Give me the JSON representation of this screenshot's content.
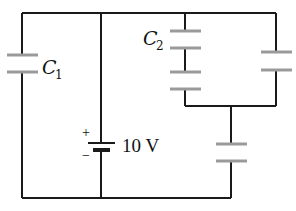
{
  "diagram": {
    "type": "circuit",
    "components": {
      "c1": {
        "label": "C",
        "subscript": "1"
      },
      "c2": {
        "label": "C",
        "subscript": "2"
      },
      "battery": {
        "voltage_label": "10 V",
        "plus": "+",
        "minus": "−"
      }
    },
    "colors": {
      "wire": "#1a1a1a",
      "plate": "#9a9a9a",
      "background": "#ffffff"
    }
  }
}
